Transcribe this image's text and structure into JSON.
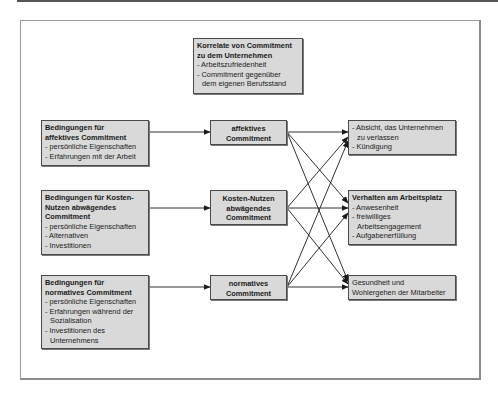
{
  "diagram": {
    "correlates": {
      "title_line1": "Korrelate von Commitment",
      "title_line2": "zu dem Unternehmen",
      "item1": "- Arbeitszufriedenheit",
      "item2": "- Commitment gegenüber",
      "item2_cont": "dem eigenen Berufsstand"
    },
    "conditions": [
      {
        "title_line1": "Bedingungen für",
        "title_line2": "affektives Commitment",
        "items": [
          "- persönliche Eigenschaften",
          "- Erfahrungen mit der Arbeit"
        ]
      },
      {
        "title_line1": "Bedingungen für Kosten-",
        "title_line2": "Nutzen abwägendes",
        "title_line3": "Commitment",
        "items": [
          "- persönliche Eigenschaften",
          "- Alternativen",
          "- Investitionen"
        ]
      },
      {
        "title_line1": "Bedingungen für",
        "title_line2": "normatives Commitment",
        "items": [
          "- persönliche Eigenschaften",
          "- Erfahrungen während der",
          "Sozialisation",
          "- Investitionen des",
          "Unternehmens"
        ]
      }
    ],
    "commitments": [
      {
        "line1": "affektives",
        "line2": "Commitment"
      },
      {
        "line1": "Kosten-Nutzen",
        "line2": "abwägendes",
        "line3": "Commitment"
      },
      {
        "line1": "normatives",
        "line2": "Commitment"
      }
    ],
    "outcomes": [
      {
        "items": [
          "- Absicht, das Unternehmen",
          "zu verlassen",
          "- Kündigung"
        ]
      },
      {
        "title": "Verhalten am Arbeitsplatz",
        "items": [
          "- Anwesenheit",
          "- freiwilliges",
          "Arbeitsengagement",
          "- Aufgabenerfüllung"
        ]
      },
      {
        "items": [
          "Gesundheit und",
          "Wohlergehen der Mitarbeiter"
        ]
      }
    ],
    "colors": {
      "box_fill": "#d9d9d9",
      "box_border": "#4a4a4a",
      "arrow": "#1a1a1a",
      "frame": "#9a9a9a"
    }
  }
}
